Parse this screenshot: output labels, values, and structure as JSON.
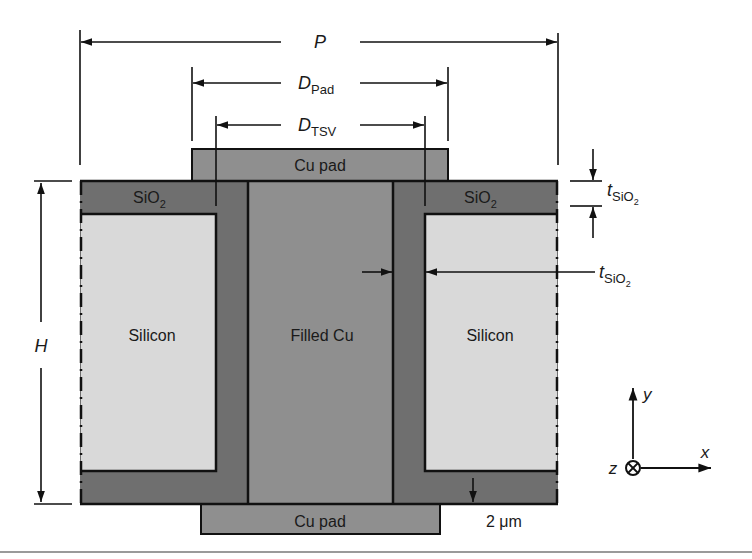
{
  "figure": {
    "colors": {
      "background": "#ffffff",
      "cu": "#8f8f8f",
      "sio2": "#6f6f6f",
      "silicon": "#d9d9d9",
      "line": "#111111",
      "divider": "#9a9a9a"
    },
    "regions": {
      "cu_pad_top": "Cu pad",
      "cu_pad_bottom": "Cu pad",
      "sio2_left": "SiO",
      "sio2_right": "SiO",
      "sio2_sub": "2",
      "silicon_left": "Silicon",
      "silicon_right": "Silicon",
      "filled_cu": "Filled Cu"
    },
    "dimensions": {
      "pitch": {
        "symbol": "P"
      },
      "pad_diameter": {
        "symbol": "D",
        "sub": "Pad"
      },
      "tsv_diameter": {
        "symbol": "D",
        "sub": "TSV"
      },
      "height": {
        "symbol": "H"
      },
      "oxide_top": {
        "symbol": "t",
        "sub": "SiO",
        "subsub": "2"
      },
      "oxide_liner": {
        "symbol": "t",
        "sub": "SiO",
        "subsub": "2"
      },
      "bottom_oxide": {
        "value": "2 μm"
      }
    },
    "axes": {
      "x": "x",
      "y": "y",
      "z": "z",
      "z_symbol": "⊗"
    }
  }
}
